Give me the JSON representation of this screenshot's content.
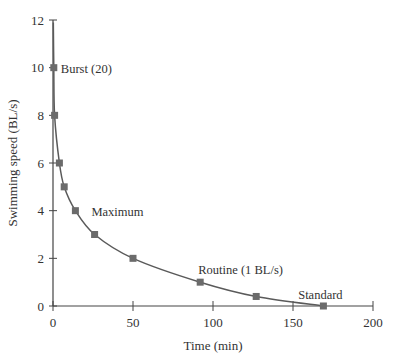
{
  "chart_data": {
    "type": "line",
    "title": "",
    "xlabel": "Time (min)",
    "ylabel": "Swimming speed (BL/s)",
    "xlim": [
      0,
      200
    ],
    "ylim": [
      0,
      12
    ],
    "xticks": [
      0,
      50,
      100,
      150,
      200
    ],
    "yticks": [
      0,
      2,
      4,
      6,
      8,
      10,
      12
    ],
    "grid": false,
    "legend": null,
    "series": [
      {
        "name": "Swimming speed vs endurance time",
        "marker": "square",
        "x": [
          0.5,
          1,
          4,
          7,
          14,
          26,
          50,
          92,
          127,
          169
        ],
        "y": [
          10,
          8,
          6,
          5,
          4,
          3,
          2,
          1,
          0.4,
          0
        ]
      }
    ],
    "annotations": [
      {
        "text": "Burst (20)",
        "x": 0.5,
        "y": 10
      },
      {
        "text": "Maximum",
        "x": 24,
        "y": 4
      },
      {
        "text": "Routine (1 BL/s)",
        "x": 92,
        "y": 1
      },
      {
        "text": "Standard",
        "x": 152,
        "y": 0
      }
    ]
  },
  "colors": {
    "line": "#5a5a5a",
    "marker": "#6b6b6b",
    "axis": "#444444",
    "text": "#333333"
  }
}
